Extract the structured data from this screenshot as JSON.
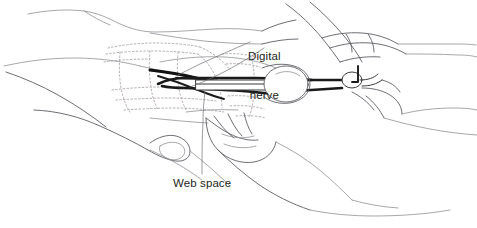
{
  "figure": {
    "type": "medical-line-illustration",
    "background_color": "#ffffff",
    "width": 477,
    "height": 228,
    "line_color": "#5c5e63",
    "instrument_color": "#1a1a1a",
    "dotted_anatomy_color": "#a9a2a8",
    "label_color": "#231f20"
  },
  "labels": {
    "digital_nerve": {
      "line1": "Digital",
      "line2": "nerve"
    },
    "web_space": {
      "text": "Web space"
    }
  },
  "elements": {
    "patient_hand": "patient-hand-outline",
    "surgeon_hand": "surgeon-hand-outline",
    "instrument": "hemostat-forceps",
    "nerve_strand": "digital-nerve-strand",
    "hidden_anatomy": "dotted-underlying-anatomy",
    "leader_line_nerve_a": "leader-line-digital-nerve-a",
    "leader_line_nerve_b": "leader-line-digital-nerve-b",
    "leader_line_web": "leader-line-web-space"
  }
}
